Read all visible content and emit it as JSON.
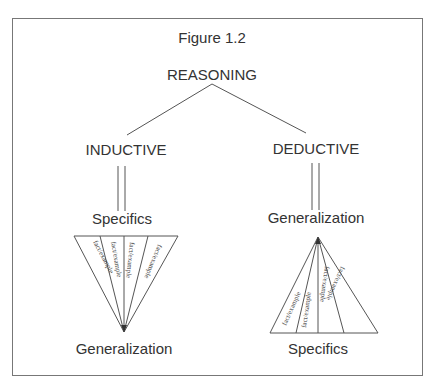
{
  "figure": {
    "title": "Figure 1.2",
    "root": "REASONING",
    "branches": [
      {
        "label": "INDUCTIVE",
        "top": "Specifics",
        "bottom": "Generalization",
        "fan_items": [
          "fact/example",
          "fact/example",
          "fact/example",
          "fact/example"
        ]
      },
      {
        "label": "DEDUCTIVE",
        "top": "Generalization",
        "bottom": "Specifics",
        "fan_items": [
          "fact/example",
          "fact/example",
          "fact/example",
          "fact/example"
        ]
      }
    ]
  },
  "colors": {
    "line": "#444444",
    "text": "#333333",
    "frame": "#777777"
  }
}
